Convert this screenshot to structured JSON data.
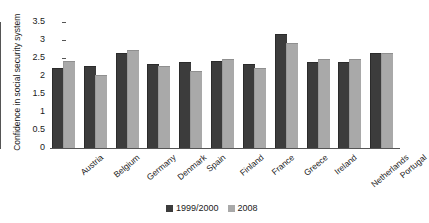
{
  "chart_data": {
    "type": "bar",
    "title": "",
    "subtitle": "",
    "xlabel": "",
    "ylabel": "Confidence in social security system",
    "ylim": [
      0,
      3.5
    ],
    "yticks": [
      "0",
      "0.5",
      "1",
      "1.5",
      "2",
      "2.5",
      "3",
      "3.5"
    ],
    "ytick_values": [
      0,
      0.5,
      1,
      1.5,
      2,
      2.5,
      3,
      3.5
    ],
    "grid": false,
    "legend_position": "bottom-center",
    "categories": [
      "Austria",
      "Belgium",
      "Germany",
      "Denmark",
      "Spain",
      "Finland",
      "France",
      "Greece",
      "Ireland",
      "Netherlands",
      "Portugal"
    ],
    "series": [
      {
        "name": "1999/2000",
        "color": "#3c3c3c",
        "values": [
          2.2,
          2.25,
          2.6,
          2.3,
          2.35,
          2.4,
          2.3,
          3.15,
          2.35,
          2.35,
          2.6
        ]
      },
      {
        "name": "2008",
        "color": "#a9a9a9",
        "values": [
          2.4,
          2.0,
          2.7,
          2.25,
          2.1,
          2.45,
          2.2,
          2.9,
          2.45,
          2.45,
          2.6
        ]
      }
    ]
  },
  "legend": {
    "items": [
      {
        "label": "1999/2000",
        "color": "#3c3c3c"
      },
      {
        "label": "2008",
        "color": "#a9a9a9"
      }
    ]
  }
}
